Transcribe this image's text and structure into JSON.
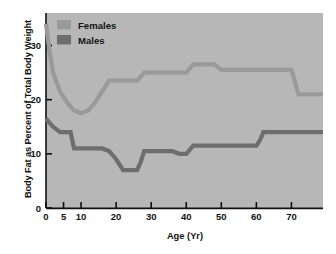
{
  "chart_data": {
    "type": "line",
    "title": "",
    "xlabel": "Age (Yr)",
    "ylabel": "Body Fat as Percent of Total Body Weight",
    "xlim": [
      0,
      79
    ],
    "ylim": [
      0,
      36
    ],
    "xticks": [
      0,
      5,
      10,
      20,
      30,
      40,
      50,
      60,
      70
    ],
    "xtick_labels": [
      "0",
      "5",
      "10",
      "20",
      "30",
      "40",
      "50",
      "60",
      "70"
    ],
    "yticks": [
      0,
      10,
      20,
      30
    ],
    "ytick_labels": [
      "0",
      "10",
      "20",
      "30"
    ],
    "grid": false,
    "legend_position": "top-left",
    "plot_background": "#b7b7b7",
    "series": [
      {
        "name": "Females",
        "color": "#9a9a9a",
        "x": [
          0,
          1,
          2,
          4,
          6,
          8,
          10,
          12,
          14,
          16,
          18,
          20,
          24,
          26,
          28,
          30,
          34,
          36,
          38,
          40,
          42,
          46,
          48,
          50,
          56,
          58,
          60,
          66,
          68,
          70,
          72,
          79
        ],
        "y": [
          34,
          29,
          25,
          21.5,
          19.5,
          18,
          17.5,
          18,
          19.5,
          21.5,
          23.5,
          23.5,
          23.5,
          23.5,
          25,
          25,
          25,
          25,
          25,
          25,
          26.5,
          26.5,
          26.5,
          25.5,
          25.5,
          25.5,
          25.5,
          25.5,
          25.5,
          25.5,
          21,
          21
        ]
      },
      {
        "name": "Males",
        "color": "#6e6e6e",
        "x": [
          0,
          2,
          4,
          6,
          7,
          8,
          12,
          14,
          16,
          18,
          20,
          22,
          24,
          26,
          27,
          28,
          32,
          36,
          38,
          40,
          42,
          48,
          52,
          56,
          58,
          60,
          61,
          62,
          66,
          72,
          79
        ],
        "y": [
          16.5,
          15,
          14,
          14,
          14,
          11,
          11,
          11,
          11,
          10.5,
          9,
          7,
          7,
          7,
          8.5,
          10.5,
          10.5,
          10.5,
          10,
          10,
          11.5,
          11.5,
          11.5,
          11.5,
          11.5,
          11.5,
          12.5,
          14,
          14,
          14,
          14
        ]
      }
    ]
  },
  "legend": {
    "entries": [
      {
        "label": "Females",
        "swatch_color": "#9a9a9a"
      },
      {
        "label": "Males",
        "swatch_color": "#6e6e6e"
      }
    ]
  }
}
